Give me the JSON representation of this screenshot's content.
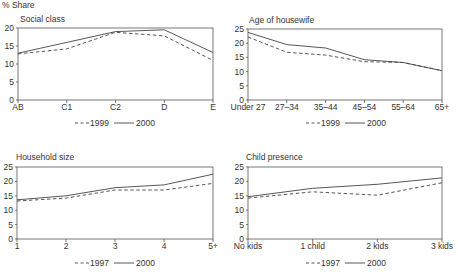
{
  "page": {
    "y_axis_label": "% Share"
  },
  "colors": {
    "line": "#444444",
    "axis": "#555555",
    "background": "#ffffff"
  },
  "chart_data": [
    {
      "type": "line",
      "title": "Social class",
      "xlabel": "",
      "ylabel": "% Share",
      "categories": [
        "AB",
        "C1",
        "C2",
        "D",
        "E"
      ],
      "ylim": [
        0,
        20
      ],
      "yticks": [
        0,
        5,
        10,
        15,
        20
      ],
      "grid": false,
      "legend_position": "bottom",
      "series": [
        {
          "name": "1999",
          "style": "dashed",
          "values": [
            12.8,
            14.2,
            18.8,
            17.8,
            11.0
          ]
        },
        {
          "name": "2000",
          "style": "solid",
          "values": [
            13.0,
            16.0,
            19.0,
            19.5,
            13.2
          ]
        }
      ]
    },
    {
      "type": "line",
      "title": "Age of housewife",
      "xlabel": "",
      "ylabel": "% Share",
      "categories": [
        "Under 27",
        "27–34",
        "35–44",
        "45–54",
        "55–64",
        "65+"
      ],
      "ylim": [
        0,
        25
      ],
      "yticks": [
        0,
        5,
        10,
        15,
        20,
        25
      ],
      "grid": false,
      "legend_position": "bottom",
      "series": [
        {
          "name": "1999",
          "style": "dashed",
          "values": [
            22.2,
            16.8,
            15.8,
            13.5,
            13.2,
            10.3
          ]
        },
        {
          "name": "2000",
          "style": "solid",
          "values": [
            23.8,
            19.5,
            18.3,
            14.2,
            13.2,
            10.3
          ]
        }
      ]
    },
    {
      "type": "line",
      "title": "Household size",
      "xlabel": "",
      "ylabel": "% Share",
      "categories": [
        "1",
        "2",
        "3",
        "4",
        "5+"
      ],
      "ylim": [
        0,
        25
      ],
      "yticks": [
        0,
        5,
        10,
        15,
        20,
        25
      ],
      "grid": false,
      "legend_position": "bottom",
      "series": [
        {
          "name": "1997",
          "style": "dashed",
          "values": [
            13.2,
            14.2,
            17.0,
            17.0,
            19.3
          ]
        },
        {
          "name": "2000",
          "style": "solid",
          "values": [
            13.6,
            15.0,
            17.8,
            18.8,
            22.5
          ]
        }
      ]
    },
    {
      "type": "line",
      "title": "Child presence",
      "xlabel": "",
      "ylabel": "% Share",
      "categories": [
        "No kids",
        "1 child",
        "2 kids",
        "3 kids"
      ],
      "ylim": [
        0,
        25
      ],
      "yticks": [
        0,
        5,
        10,
        15,
        20,
        25
      ],
      "grid": false,
      "legend_position": "bottom",
      "series": [
        {
          "name": "1997",
          "style": "dashed",
          "values": [
            14.2,
            16.4,
            15.2,
            19.5
          ]
        },
        {
          "name": "2000",
          "style": "solid",
          "values": [
            14.7,
            17.6,
            19.0,
            21.2
          ]
        }
      ]
    }
  ]
}
